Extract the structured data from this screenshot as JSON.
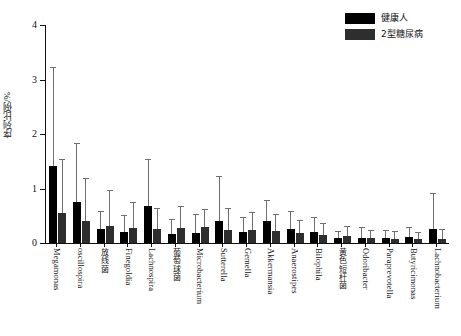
{
  "chart_data": {
    "type": "bar",
    "title": "",
    "xlabel": "",
    "ylabel": "序列比例/%",
    "ylim": [
      0,
      4
    ],
    "yticks": [
      0,
      1,
      2,
      3,
      4
    ],
    "ytick_labels": [
      "0",
      "1",
      "2",
      "3",
      "4"
    ],
    "grid": false,
    "legend_position": "top-right",
    "orientation": "vertical",
    "error_bars": "upper-only",
    "categories": [
      "Megamonas",
      "oscillospira",
      "放线菌",
      "Finegoldia",
      "Lachnospira",
      "葡萄球菌",
      "Microbacterium",
      "Sutterella",
      "Gemella",
      "Akkermansia",
      "Anaerostipes",
      "Bilophila",
      "黄色短杆菌",
      "Odoribacter",
      "Paraprevotella",
      "Butyricimonas",
      "Lachnobacterium"
    ],
    "series": [
      {
        "name": "健康人",
        "color": "#000000",
        "values": [
          1.42,
          0.75,
          0.25,
          0.2,
          0.68,
          0.17,
          0.19,
          0.41,
          0.21,
          0.41,
          0.25,
          0.21,
          0.1,
          0.1,
          0.09,
          0.11,
          0.25
        ],
        "errors_upper": [
          3.22,
          1.82,
          0.56,
          0.5,
          1.52,
          0.42,
          0.52,
          1.22,
          0.45,
          0.78,
          0.57,
          0.46,
          0.21,
          0.27,
          0.22,
          0.27,
          0.9
        ]
      },
      {
        "name": "2型糖尿病",
        "color": "#2e2e2e",
        "values": [
          0.55,
          0.4,
          0.31,
          0.27,
          0.25,
          0.28,
          0.3,
          0.24,
          0.23,
          0.22,
          0.18,
          0.14,
          0.13,
          0.09,
          0.08,
          0.07,
          0.07
        ],
        "errors_upper": [
          1.52,
          1.18,
          0.96,
          0.73,
          0.62,
          0.66,
          0.61,
          0.62,
          0.55,
          0.52,
          0.4,
          0.34,
          0.3,
          0.22,
          0.21,
          0.19,
          0.23
        ]
      }
    ]
  },
  "legend": {
    "items": [
      {
        "label": "健康人"
      },
      {
        "label": "2型糖尿病"
      }
    ]
  }
}
